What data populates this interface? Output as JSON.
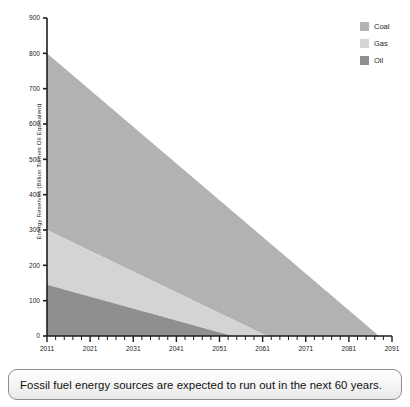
{
  "chart_data": {
    "type": "area",
    "stacked": true,
    "title": "",
    "xlabel": "",
    "ylabel": "Energy Reserves (Billion Tonnes Oil Equivalent)",
    "xlim": [
      2011,
      2091
    ],
    "ylim": [
      0,
      900
    ],
    "x_ticks": [
      2011,
      2021,
      2031,
      2041,
      2051,
      2061,
      2071,
      2081,
      2091
    ],
    "x_minor_tick_step": 2,
    "y_ticks": [
      0,
      100,
      200,
      300,
      400,
      500,
      600,
      700,
      800,
      900
    ],
    "grid": false,
    "legend_position": "top-right",
    "series": [
      {
        "name": "Coal",
        "color": "#b2b2b2",
        "start_year": 2011,
        "end_year": 2088,
        "start_value": 500,
        "end_value": 0,
        "stack_top_start": 800,
        "note": "Top band; stacked total reaches 800 at 2011 and 0 at 2088"
      },
      {
        "name": "Gas",
        "color": "#d4d4d4",
        "start_year": 2011,
        "end_year": 2062,
        "start_value": 155,
        "end_value": 0,
        "stack_top_start": 300,
        "note": "Middle band; cumulative top 300 at 2011, depleted 2062"
      },
      {
        "name": "Oil",
        "color": "#8f8f8f",
        "start_year": 2011,
        "end_year": 2054,
        "start_value": 145,
        "end_value": 0,
        "stack_top_start": 145,
        "note": "Bottom band; 145 at 2011, depleted 2054"
      }
    ],
    "legend": [
      {
        "label": "Coal",
        "color": "#b2b2b2"
      },
      {
        "label": "Gas",
        "color": "#d4d4d4"
      },
      {
        "label": "Oil",
        "color": "#8f8f8f"
      }
    ],
    "axis_color": "#1d1d1d"
  },
  "caption": {
    "text": "Fossil fuel energy sources are expected to run out in the next 60 years."
  }
}
